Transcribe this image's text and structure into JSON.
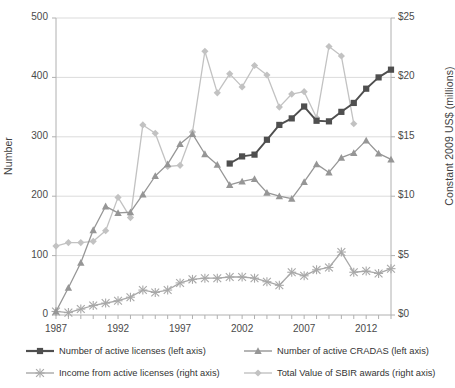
{
  "chart_data": {
    "type": "line",
    "title": "",
    "xlabel": "",
    "ylabel": "Number",
    "y2label": "Constant 2009 US$ (millions)",
    "grid": true,
    "legend_position": "bottom",
    "x": [
      1987,
      1988,
      1989,
      1990,
      1991,
      1992,
      1993,
      1994,
      1995,
      1996,
      1997,
      1998,
      1999,
      2000,
      2001,
      2002,
      2003,
      2004,
      2005,
      2006,
      2007,
      2008,
      2009,
      2010,
      2011,
      2012,
      2013,
      2014
    ],
    "xlim": [
      1987,
      2014
    ],
    "xticks": [
      1987,
      1992,
      1997,
      2002,
      2007,
      2012
    ],
    "xtick_labels": [
      "1987",
      "1992",
      "1997",
      "2002",
      "2007",
      "2012"
    ],
    "ylim": [
      0,
      500
    ],
    "yticks": [
      0,
      100,
      200,
      300,
      400,
      500
    ],
    "ytick_labels": [
      "0",
      "100",
      "200",
      "300",
      "400",
      "500"
    ],
    "y2lim": [
      0,
      25
    ],
    "y2ticks": [
      0,
      5,
      10,
      15,
      20,
      25
    ],
    "y2tick_labels": [
      "$0",
      "$5",
      "$10",
      "$15",
      "$20",
      "$25"
    ],
    "series": [
      {
        "name": "Number of active licenses (left axis)",
        "axis": "left",
        "marker": "square",
        "color": "#4f4f4f",
        "x": [
          2001,
          2002,
          2003,
          2004,
          2005,
          2006,
          2007,
          2008,
          2009,
          2010,
          2011,
          2012,
          2013,
          2014
        ],
        "values": [
          255,
          267,
          270,
          295,
          320,
          331,
          351,
          327,
          326,
          342,
          357,
          381,
          400,
          413
        ]
      },
      {
        "name": "Number of active CRADAS (left axis)",
        "axis": "left",
        "marker": "triangle",
        "color": "#969696",
        "x": [
          1987,
          1988,
          1989,
          1990,
          1991,
          1992,
          1993,
          1994,
          1995,
          1996,
          1997,
          1998,
          1999,
          2000,
          2001,
          2002,
          2003,
          2004,
          2005,
          2006,
          2007,
          2008,
          2009,
          2010,
          2011,
          2012,
          2013,
          2014
        ],
        "values": [
          6,
          46,
          88,
          143,
          183,
          172,
          173,
          203,
          234,
          254,
          288,
          305,
          271,
          253,
          219,
          225,
          229,
          206,
          200,
          196,
          224,
          254,
          240,
          265,
          273,
          294,
          272,
          262
        ]
      },
      {
        "name": "Income from active licenses (right axis)",
        "axis": "right",
        "marker": "x",
        "color": "#a8a8a8",
        "x": [
          1987,
          1988,
          1989,
          1990,
          1991,
          1992,
          1993,
          1994,
          1995,
          1996,
          1997,
          1998,
          1999,
          2000,
          2001,
          2002,
          2003,
          2004,
          2005,
          2006,
          2007,
          2008,
          2009,
          2010,
          2011,
          2012,
          2013,
          2014
        ],
        "values": [
          0.3,
          0.2,
          0.5,
          0.8,
          1.0,
          1.2,
          1.5,
          2.1,
          1.9,
          2.1,
          2.7,
          3.0,
          3.1,
          3.1,
          3.2,
          3.2,
          3.1,
          2.8,
          2.5,
          3.6,
          3.3,
          3.8,
          4.0,
          5.3,
          3.6,
          3.7,
          3.5,
          3.9
        ]
      },
      {
        "name": "Total Value of SBIR awards (right axis)",
        "axis": "right",
        "marker": "diamond",
        "color": "#c2c2c2",
        "x": [
          1987,
          1988,
          1989,
          1990,
          1991,
          1992,
          1993,
          1994,
          1995,
          1996,
          1997,
          1998,
          1999,
          2000,
          2001,
          2002,
          2003,
          2004,
          2005,
          2006,
          2007,
          2008,
          2009,
          2010,
          2011
        ],
        "values": [
          5.8,
          6.1,
          6.1,
          6.2,
          7.1,
          9.9,
          8.2,
          16.0,
          15.3,
          12.5,
          12.6,
          15.4,
          22.2,
          18.7,
          20.3,
          19.2,
          21.0,
          20.2,
          17.5,
          18.6,
          18.8,
          16.6,
          22.6,
          21.8,
          16.1
        ]
      }
    ]
  },
  "axes": {
    "left_title": "Number",
    "right_title": "Constant 2009 US$ (millions)"
  },
  "legend": {
    "items": [
      {
        "label": "Number of active licenses (left axis)",
        "marker": "square-marker",
        "color": "#4f4f4f"
      },
      {
        "label": "Number of active CRADAS (left axis)",
        "marker": "triangle-marker",
        "color": "#969696"
      },
      {
        "label": "Income from active licenses (right axis)",
        "marker": "x-marker",
        "color": "#a8a8a8"
      },
      {
        "label": "Total Value of SBIR awards (right axis)",
        "marker": "diamond-marker",
        "color": "#c2c2c2"
      }
    ]
  }
}
